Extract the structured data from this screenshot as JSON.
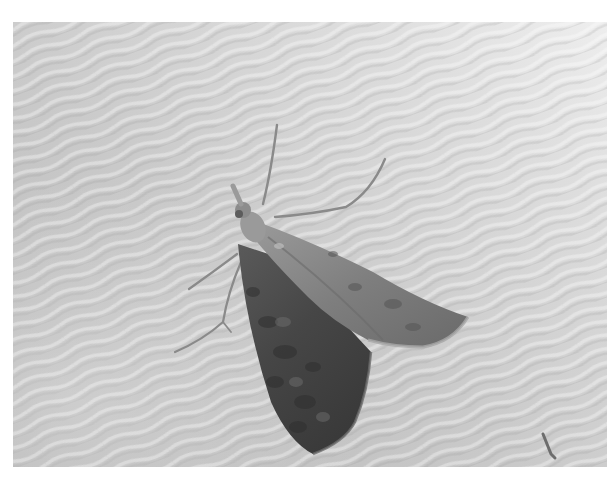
{
  "image": {
    "subject": "moth",
    "description": "Grayscale photograph of a moth with triangular wings resting on wavy, rippled white fabric",
    "palette": {
      "border": "#ffffff",
      "fabric_light": "#e6e6e6",
      "fabric_mid": "#c9c9c9",
      "fabric_shadow": "#a9a9a9",
      "wing_light": "#8e8e8e",
      "wing_dark": "#4a4a4a",
      "wing_darkest": "#333333",
      "legs": "#8a8a8a"
    },
    "frame": {
      "x": 13,
      "y": 22,
      "width": 594,
      "height": 445
    }
  }
}
